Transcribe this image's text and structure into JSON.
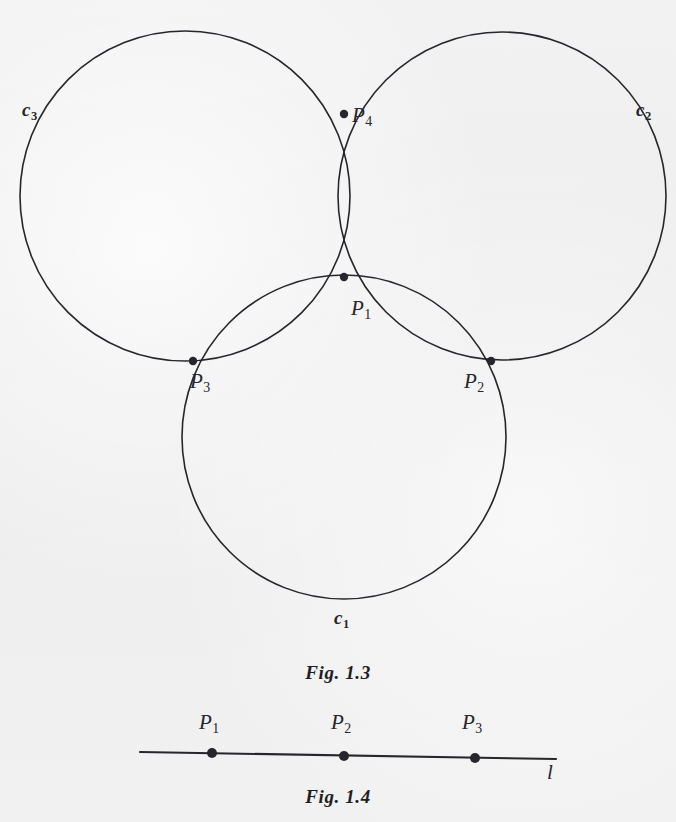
{
  "page": {
    "background_color": "#f1f0f1",
    "ink_color": "#26262c",
    "cropped_header_text": ""
  },
  "figures": [
    {
      "id": "fig-1-3",
      "caption": "Fig. 1.3",
      "caption_y": 662,
      "description": "Three mutually intersecting circles",
      "circles": [
        {
          "name": "c1",
          "label": "c",
          "sub": "1",
          "cx": 344,
          "cy": 437,
          "r": 162,
          "label_x": 334,
          "label_y": 608
        },
        {
          "name": "c2",
          "label": "c",
          "sub": "2",
          "cx": 502,
          "cy": 196,
          "r": 164,
          "label_x": 636,
          "label_y": 100
        },
        {
          "name": "c3",
          "label": "c",
          "sub": "3",
          "cx": 185,
          "cy": 196,
          "r": 165,
          "label_x": 22,
          "label_y": 100
        }
      ],
      "points": [
        {
          "name": "P1",
          "label": "P",
          "sub": "1",
          "x": 344,
          "y": 277,
          "label_x": 351,
          "label_y": 298
        },
        {
          "name": "P2",
          "label": "P",
          "sub": "2",
          "x": 491,
          "y": 361,
          "label_x": 464,
          "label_y": 371
        },
        {
          "name": "P3",
          "label": "P",
          "sub": "3",
          "x": 193,
          "y": 361,
          "label_x": 190,
          "label_y": 371
        },
        {
          "name": "P4",
          "label": "P",
          "sub": "4",
          "x": 344,
          "y": 114,
          "label_x": 352,
          "label_y": 105
        }
      ]
    },
    {
      "id": "fig-1-4",
      "caption": "Fig. 1.4",
      "caption_y": 786,
      "description": "A straight line l with three marked points",
      "line": {
        "name": "l",
        "label": "l",
        "x1": 140,
        "y1": 752,
        "x2": 556,
        "y2": 759,
        "label_x": 547,
        "label_y": 762
      },
      "points": [
        {
          "name": "P1",
          "label": "P",
          "sub": "1",
          "x": 212,
          "y": 753,
          "label_x": 199,
          "label_y": 712
        },
        {
          "name": "P2",
          "label": "P",
          "sub": "2",
          "x": 344,
          "y": 756,
          "label_x": 331,
          "label_y": 712
        },
        {
          "name": "P3",
          "label": "P",
          "sub": "3",
          "x": 475,
          "y": 758,
          "label_x": 462,
          "label_y": 712
        }
      ]
    }
  ]
}
